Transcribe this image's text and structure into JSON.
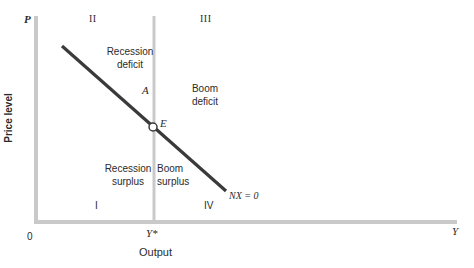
{
  "diagram": {
    "axes": {
      "y_axis_symbol": "P",
      "y_axis_label": "Price level",
      "x_axis_symbol": "Y",
      "x_axis_label": "Output",
      "origin_label": "0",
      "full_employment_label": "Y*"
    },
    "quadrants": {
      "q1": "I",
      "q2": "II",
      "q3": "III",
      "q4": "IV"
    },
    "regions": {
      "recession_deficit": [
        "Recession",
        "deficit"
      ],
      "boom_deficit": [
        "Boom",
        "deficit"
      ],
      "recession_surplus": [
        "Recession",
        "surplus"
      ],
      "boom_surplus": [
        "Boom",
        "surplus"
      ]
    },
    "points": {
      "A": "A",
      "E": "E"
    },
    "curve": {
      "label": "NX = 0"
    },
    "colors": {
      "axis": "#c8c8c8",
      "curve": "#3a3a3a",
      "text": "#2b2b2b",
      "background": "#ffffff"
    }
  }
}
